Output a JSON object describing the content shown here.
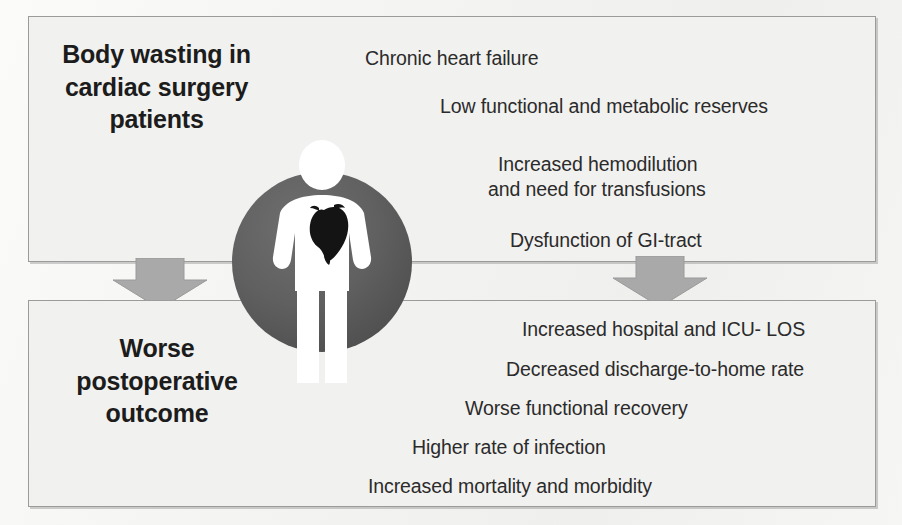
{
  "diagram": {
    "title_alt": "Body wasting in cardiac surgery patients leading to worse postoperative outcome",
    "colors": {
      "panel_fill": "#f1f1ef",
      "panel_border": "#9b9b9b",
      "arrow_fill": "#a6a6a6",
      "circle_dark": "#595959",
      "circle_mid": "#6e6e6e",
      "figure_white": "#ffffff",
      "heart_black": "#141414",
      "text_dark": "#1c1c1c"
    }
  },
  "top_panel": {
    "heading": "Body wasting in cardiac surgery patients",
    "items": [
      {
        "text": "Chronic heart failure",
        "x": 365,
        "y": 46
      },
      {
        "text": "Low functional and metabolic reserves",
        "x": 440,
        "y": 94
      },
      {
        "text": "Increased hemodilution",
        "x": 498,
        "y": 152
      },
      {
        "text": "and need for transfusions",
        "x": 488,
        "y": 177
      },
      {
        "text": "Dysfunction of GI-tract",
        "x": 510,
        "y": 228
      }
    ]
  },
  "bottom_panel": {
    "heading": "Worse postoperative outcome",
    "items": [
      {
        "text": "Increased hospital and ICU- LOS",
        "x": 522,
        "y": 317
      },
      {
        "text": "Decreased discharge-to-home rate",
        "x": 506,
        "y": 357
      },
      {
        "text": "Worse functional recovery",
        "x": 465,
        "y": 396
      },
      {
        "text": "Higher rate of infection",
        "x": 412,
        "y": 435
      },
      {
        "text": "Increased mortality and morbidity",
        "x": 368,
        "y": 474
      }
    ]
  },
  "arrows": [
    {
      "name": "arrow-down-left",
      "direction": "down"
    },
    {
      "name": "arrow-down-right",
      "direction": "down"
    }
  ],
  "figure": {
    "label": "human body silhouette with heart",
    "parts": [
      "head",
      "torso",
      "arms",
      "legs",
      "heart"
    ]
  },
  "background_bleed": [
    {
      "text": "A few articles can be used to understand",
      "x": 372,
      "y": 48
    },
    {
      "text": "biological features of these patients",
      "x": 360,
      "y": 110
    },
    {
      "text": "expected",
      "x": 366,
      "y": 148
    },
    {
      "text": "and the related outcome",
      "x": 430,
      "y": 333
    },
    {
      "text": "in cardiac surgery",
      "x": 455,
      "y": 392
    },
    {
      "text": "nutritional status",
      "x": 610,
      "y": 430
    },
    {
      "text": "is a strong",
      "x": 640,
      "y": 464
    }
  ]
}
